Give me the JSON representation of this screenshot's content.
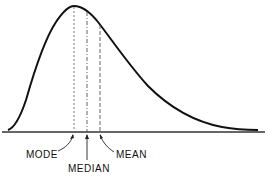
{
  "diagram": {
    "type": "skewed-distribution-curve",
    "labels": {
      "mode": "MODE",
      "median": "MEDIAN",
      "mean": "MEAN"
    },
    "colors": {
      "curve": "#111111",
      "axis": "#333333",
      "guide": "#666666"
    }
  }
}
